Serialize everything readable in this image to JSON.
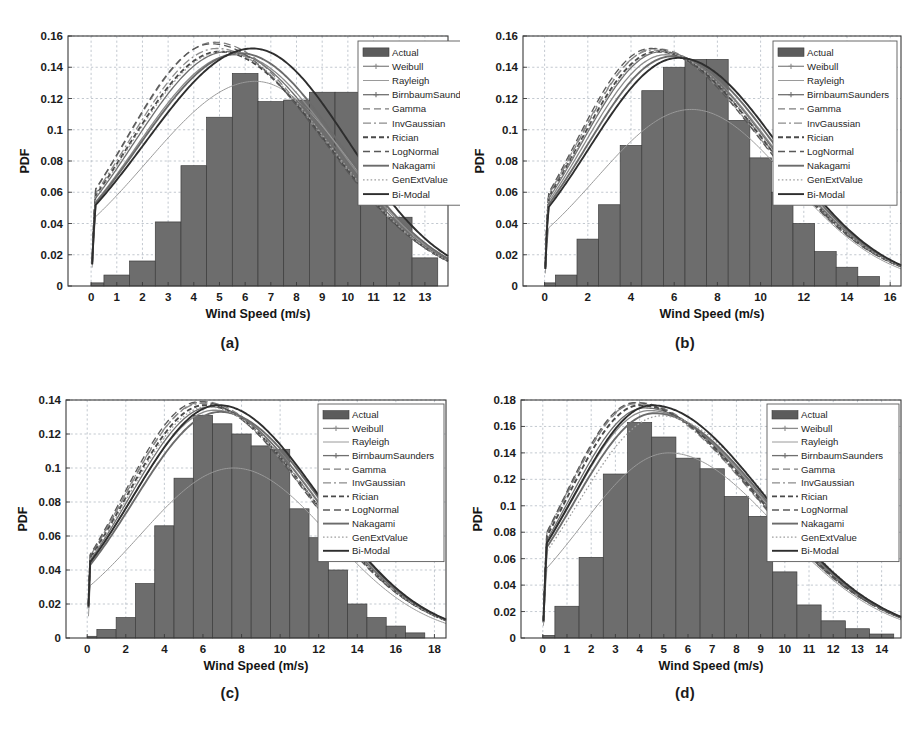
{
  "figure": {
    "background": "#ffffff",
    "bar_color": "#6d6d6d",
    "grid_color": "#9aa4b0",
    "axis_color": "#3a3a3a"
  },
  "legend_entries": [
    {
      "label": "Actual",
      "style": "patch",
      "color": "#5c5c5c"
    },
    {
      "label": "Weibull",
      "style": "line-marker",
      "color": "#8a8a8a"
    },
    {
      "label": "Rayleigh",
      "style": "solid-thin",
      "color": "#9a9a9a"
    },
    {
      "label": "BirnbaumSaunders",
      "style": "line-marker",
      "color": "#6f6f6f"
    },
    {
      "label": "Gamma",
      "style": "dash-long",
      "color": "#7d7d7d"
    },
    {
      "label": "InvGaussian",
      "style": "dash-dot",
      "color": "#8c8c8c"
    },
    {
      "label": "Rician",
      "style": "dash-thick",
      "color": "#4a4a4a"
    },
    {
      "label": "LogNormal",
      "style": "dash-long",
      "color": "#595959"
    },
    {
      "label": "Nakagami",
      "style": "solid-thick",
      "color": "#6b6b6b"
    },
    {
      "label": "GenExtValue",
      "style": "dotted",
      "color": "#9e9e9e"
    },
    {
      "label": "Bi-Modal",
      "style": "solid-thick",
      "color": "#2e2e2e"
    }
  ],
  "chart_data": [
    {
      "id": "a",
      "caption": "(a)",
      "type": "bar",
      "title": "",
      "xlabel": "Wind Speed (m/s)",
      "ylabel": "PDF",
      "xlim": [
        -0.9,
        13.9
      ],
      "ylim": [
        0,
        0.16
      ],
      "xticks": [
        0,
        1,
        2,
        3,
        4,
        5,
        6,
        7,
        8,
        9,
        10,
        11,
        12,
        13
      ],
      "yticks": [
        0,
        0.02,
        0.04,
        0.06,
        0.08,
        0.1,
        0.12,
        0.14,
        0.16
      ],
      "ytick_labels": [
        "0",
        "0.02",
        "0.04",
        "0.06",
        "0.08",
        "0.1",
        "0.12",
        "0.14",
        "0.16"
      ],
      "grid": true,
      "legend_position": "top-right-outside",
      "bin_edges": [
        0.0,
        0.5,
        1.5,
        2.5,
        3.5,
        4.5,
        5.5,
        6.5,
        7.5,
        8.5,
        9.5,
        10.5,
        11.5,
        12.5,
        13.5
      ],
      "bin_values": [
        0.002,
        0.007,
        0.016,
        0.041,
        0.077,
        0.108,
        0.136,
        0.118,
        0.119,
        0.124,
        0.124,
        0.104,
        0.044,
        0.018,
        0.003
      ],
      "curves": [
        {
          "name": "Actual",
          "peak_x": 6.0,
          "peak_y": 0.136
        },
        {
          "name": "Weibull",
          "peak_x": 5.6,
          "peak_y": 0.148
        },
        {
          "name": "Rayleigh",
          "peak_x": 6.4,
          "peak_y": 0.131
        },
        {
          "name": "BirnbaumSaunders",
          "peak_x": 5.3,
          "peak_y": 0.15
        },
        {
          "name": "Gamma",
          "peak_x": 4.8,
          "peak_y": 0.156
        },
        {
          "name": "InvGaussian",
          "peak_x": 4.9,
          "peak_y": 0.152
        },
        {
          "name": "Rician",
          "peak_x": 5.0,
          "peak_y": 0.15
        },
        {
          "name": "LogNormal",
          "peak_x": 4.7,
          "peak_y": 0.155
        },
        {
          "name": "Nakagami",
          "peak_x": 5.8,
          "peak_y": 0.149
        },
        {
          "name": "GenExtValue",
          "peak_x": 5.1,
          "peak_y": 0.15
        },
        {
          "name": "Bi-Modal",
          "peak_x": 6.3,
          "peak_y": 0.152
        }
      ]
    },
    {
      "id": "b",
      "caption": "(b)",
      "type": "bar",
      "title": "",
      "xlabel": "Wind Speed (m/s)",
      "ylabel": "PDF",
      "xlim": [
        -1.0,
        16.5
      ],
      "ylim": [
        0,
        0.16
      ],
      "xticks": [
        0,
        2,
        4,
        6,
        8,
        10,
        12,
        14,
        16
      ],
      "yticks": [
        0,
        0.02,
        0.04,
        0.06,
        0.08,
        0.1,
        0.12,
        0.14,
        0.16
      ],
      "ytick_labels": [
        "0",
        "0.02",
        "0.04",
        "0.06",
        "0.08",
        "0.1",
        "0.12",
        "0.14",
        "0.16"
      ],
      "grid": true,
      "legend_position": "top-right-inside",
      "bin_edges": [
        0.0,
        0.5,
        1.5,
        2.5,
        3.5,
        4.5,
        5.5,
        6.5,
        7.5,
        8.5,
        9.5,
        10.5,
        11.5,
        12.5,
        13.5,
        14.5,
        15.5
      ],
      "bin_values": [
        0.002,
        0.007,
        0.03,
        0.052,
        0.09,
        0.125,
        0.14,
        0.145,
        0.145,
        0.106,
        0.082,
        0.06,
        0.04,
        0.022,
        0.012,
        0.006,
        0.002
      ],
      "curves": [
        {
          "name": "Actual",
          "peak_x": 7.0,
          "peak_y": 0.145
        },
        {
          "name": "Weibull",
          "peak_x": 5.6,
          "peak_y": 0.148
        },
        {
          "name": "Rayleigh",
          "peak_x": 6.8,
          "peak_y": 0.113
        },
        {
          "name": "BirnbaumSaunders",
          "peak_x": 5.4,
          "peak_y": 0.15
        },
        {
          "name": "Gamma",
          "peak_x": 5.1,
          "peak_y": 0.152
        },
        {
          "name": "InvGaussian",
          "peak_x": 5.0,
          "peak_y": 0.151
        },
        {
          "name": "Rician",
          "peak_x": 5.2,
          "peak_y": 0.15
        },
        {
          "name": "LogNormal",
          "peak_x": 4.9,
          "peak_y": 0.152
        },
        {
          "name": "Nakagami",
          "peak_x": 5.9,
          "peak_y": 0.147
        },
        {
          "name": "GenExtValue",
          "peak_x": 5.3,
          "peak_y": 0.15
        },
        {
          "name": "Bi-Modal",
          "peak_x": 6.2,
          "peak_y": 0.146
        }
      ]
    },
    {
      "id": "c",
      "caption": "(c)",
      "type": "bar",
      "title": "",
      "xlabel": "Wind Speed (m/s)",
      "ylabel": "PDF",
      "xlim": [
        -1.1,
        18.6
      ],
      "ylim": [
        0,
        0.14
      ],
      "xticks": [
        0,
        2,
        4,
        6,
        8,
        10,
        12,
        14,
        16,
        18
      ],
      "yticks": [
        0,
        0.02,
        0.04,
        0.06,
        0.08,
        0.1,
        0.12,
        0.14
      ],
      "ytick_labels": [
        "0",
        "0.02",
        "0.04",
        "0.06",
        "0.08",
        "0.1",
        "0.12",
        "0.14"
      ],
      "grid": true,
      "legend_position": "top-right-inside",
      "bin_edges": [
        0.0,
        0.5,
        1.5,
        2.5,
        3.5,
        4.5,
        5.5,
        6.5,
        7.5,
        8.5,
        9.5,
        10.5,
        11.5,
        12.5,
        13.5,
        14.5,
        15.5,
        16.5,
        17.5
      ],
      "bin_values": [
        0.001,
        0.005,
        0.012,
        0.032,
        0.066,
        0.094,
        0.131,
        0.126,
        0.12,
        0.113,
        0.111,
        0.076,
        0.059,
        0.04,
        0.02,
        0.012,
        0.007,
        0.003,
        0.001
      ],
      "curves": [
        {
          "name": "Actual",
          "peak_x": 6.0,
          "peak_y": 0.131
        },
        {
          "name": "Weibull",
          "peak_x": 6.6,
          "peak_y": 0.134
        },
        {
          "name": "Rayleigh",
          "peak_x": 7.6,
          "peak_y": 0.1
        },
        {
          "name": "BirnbaumSaunders",
          "peak_x": 6.4,
          "peak_y": 0.136
        },
        {
          "name": "Gamma",
          "peak_x": 6.0,
          "peak_y": 0.139
        },
        {
          "name": "InvGaussian",
          "peak_x": 5.9,
          "peak_y": 0.138
        },
        {
          "name": "Rician",
          "peak_x": 6.1,
          "peak_y": 0.137
        },
        {
          "name": "LogNormal",
          "peak_x": 5.8,
          "peak_y": 0.139
        },
        {
          "name": "Nakagami",
          "peak_x": 6.9,
          "peak_y": 0.133
        },
        {
          "name": "GenExtValue",
          "peak_x": 6.2,
          "peak_y": 0.136
        },
        {
          "name": "Bi-Modal",
          "peak_x": 6.8,
          "peak_y": 0.137
        }
      ]
    },
    {
      "id": "d",
      "caption": "(d)",
      "type": "bar",
      "title": "",
      "xlabel": "Wind Speed (m/s)",
      "ylabel": "PDF",
      "xlim": [
        -0.9,
        14.8
      ],
      "ylim": [
        0,
        0.18
      ],
      "xticks": [
        0,
        1,
        2,
        3,
        4,
        5,
        6,
        7,
        8,
        9,
        10,
        11,
        12,
        13,
        14
      ],
      "yticks": [
        0,
        0.02,
        0.04,
        0.06,
        0.08,
        0.1,
        0.12,
        0.14,
        0.16,
        0.18
      ],
      "ytick_labels": [
        "0",
        "0.02",
        "0.04",
        "0.06",
        "0.08",
        "0.1",
        "0.12",
        "0.14",
        "0.16",
        "0.18"
      ],
      "grid": true,
      "legend_position": "top-right-inside",
      "bin_edges": [
        0.0,
        0.5,
        1.5,
        2.5,
        3.5,
        4.5,
        5.5,
        6.5,
        7.5,
        8.5,
        9.5,
        10.5,
        11.5,
        12.5,
        13.5,
        14.5
      ],
      "bin_values": [
        0.002,
        0.024,
        0.061,
        0.124,
        0.163,
        0.152,
        0.136,
        0.128,
        0.107,
        0.092,
        0.05,
        0.025,
        0.013,
        0.007,
        0.003,
        0.001
      ],
      "curves": [
        {
          "name": "Actual",
          "peak_x": 4.0,
          "peak_y": 0.163
        },
        {
          "name": "Weibull",
          "peak_x": 4.4,
          "peak_y": 0.172
        },
        {
          "name": "Rayleigh",
          "peak_x": 5.2,
          "peak_y": 0.14
        },
        {
          "name": "BirnbaumSaunders",
          "peak_x": 4.2,
          "peak_y": 0.174
        },
        {
          "name": "Gamma",
          "peak_x": 3.9,
          "peak_y": 0.178
        },
        {
          "name": "InvGaussian",
          "peak_x": 3.8,
          "peak_y": 0.177
        },
        {
          "name": "Rician",
          "peak_x": 4.0,
          "peak_y": 0.176
        },
        {
          "name": "LogNormal",
          "peak_x": 3.8,
          "peak_y": 0.178
        },
        {
          "name": "Nakagami",
          "peak_x": 4.6,
          "peak_y": 0.17
        },
        {
          "name": "GenExtValue",
          "peak_x": 4.9,
          "peak_y": 0.168
        },
        {
          "name": "Bi-Modal",
          "peak_x": 4.5,
          "peak_y": 0.176
        }
      ]
    }
  ]
}
